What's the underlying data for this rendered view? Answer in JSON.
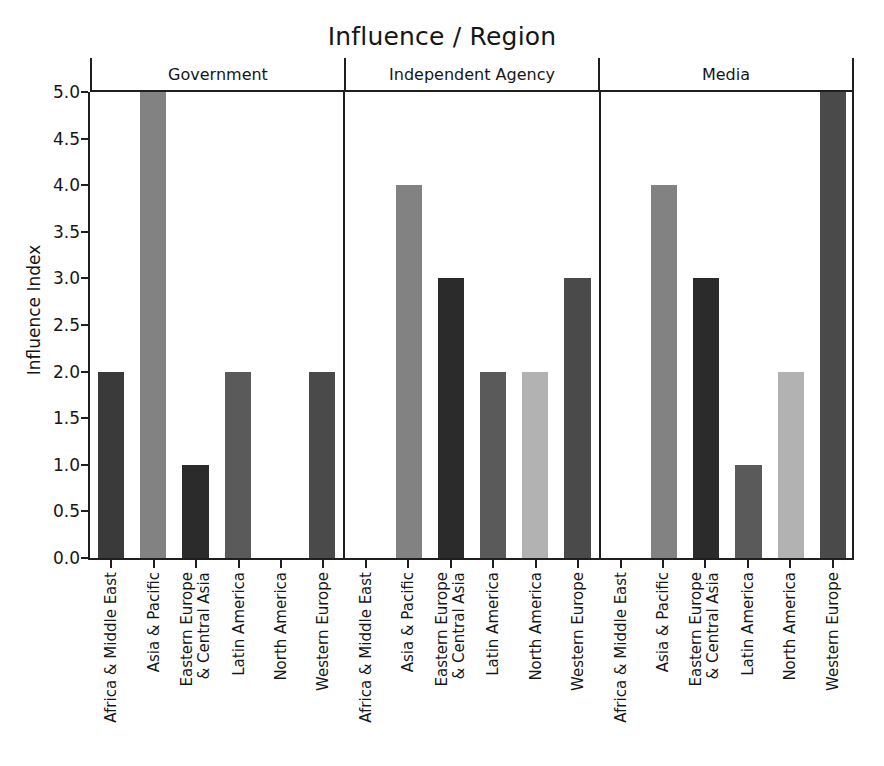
{
  "chart_data": {
    "type": "bar",
    "title": "Influence / Region",
    "xlabel": "",
    "ylabel": "Influence Index",
    "ylim": [
      0.0,
      5.0
    ],
    "grid": false,
    "legend": false,
    "facet_variable": "Influence",
    "facets": [
      "Government",
      "Independent Agency",
      "Media"
    ],
    "categories": [
      "Africa & Middle East",
      "Asia & Pacific",
      "Eastern Europe & Central Asia",
      "Latin America",
      "North America",
      "Western Europe"
    ],
    "category_lines": [
      [
        "Africa & Middle East"
      ],
      [
        "Asia & Pacific"
      ],
      [
        "Eastern Europe",
        "& Central Asia"
      ],
      [
        "Latin America"
      ],
      [
        "North America"
      ],
      [
        "Western Europe"
      ]
    ],
    "yticks": [
      "0.0",
      "0.5",
      "1.0",
      "1.5",
      "2.0",
      "2.5",
      "3.0",
      "3.5",
      "4.0",
      "4.5",
      "5.0"
    ],
    "ytick_values": [
      0.0,
      0.5,
      1.0,
      1.5,
      2.0,
      2.5,
      3.0,
      3.5,
      4.0,
      4.5,
      5.0
    ],
    "series": [
      {
        "name": "Government",
        "values": [
          2,
          5,
          1,
          2,
          0,
          2
        ]
      },
      {
        "name": "Independent Agency",
        "values": [
          0,
          4,
          3,
          2,
          2,
          3
        ]
      },
      {
        "name": "Media",
        "values": [
          0,
          4,
          3,
          1,
          2,
          5
        ]
      }
    ],
    "bar_colors": {
      "Africa & Middle East": "#3a3a3a",
      "Asia & Pacific": "#828282",
      "Eastern Europe & Central Asia": "#2b2b2b",
      "Latin America": "#5a5a5a",
      "North America": "#b2b2b2",
      "Western Europe": "#4a4a4a"
    },
    "colors": {
      "background": "#ffffff",
      "axis": "#1f1f1f",
      "text": "#161616"
    }
  }
}
